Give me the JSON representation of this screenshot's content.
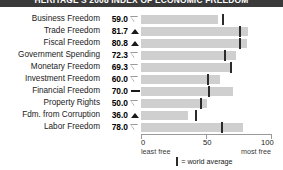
{
  "title": "HERITAGE'S 2008 INDEX OF ECONOMIC FREEDOM",
  "colors": {
    "bar": "#cfcfcf",
    "tick": "#2b2b2b",
    "titlebar": "#3a3a3a",
    "text": "#1a1a1a"
  },
  "chart_data": {
    "type": "bar",
    "title": "HERITAGE'S 2008 INDEX OF ECONOMIC FREEDOM",
    "orientation": "horizontal",
    "xlabel": "",
    "ylabel": "",
    "xlim": [
      0,
      100
    ],
    "ticks": [
      0,
      50,
      100
    ],
    "tick_labels": [
      "0",
      "50",
      "100"
    ],
    "axis_low_label": "least free",
    "axis_high_label": "most free",
    "grid": false,
    "legend": "= world average",
    "legend_position": "bottom-center",
    "categories": [
      "Business Freedom",
      "Trade Freedom",
      "Fiscal Freedom",
      "Government Spending",
      "Monetary Freedom",
      "Investment Freedom",
      "Financial Freedom",
      "Property Rights",
      "Fdm. from Corruption",
      "Labor Freedom"
    ],
    "values": [
      59.0,
      81.7,
      80.8,
      72.3,
      69.3,
      60.0,
      70.0,
      50.0,
      36.0,
      78.0
    ],
    "world_average": [
      62.0,
      75.0,
      75.0,
      63.0,
      68.0,
      50.0,
      51.0,
      45.0,
      41.0,
      61.0
    ],
    "trend": [
      "down",
      "up",
      "up",
      "down",
      "down",
      "down",
      "flat",
      "down",
      "up",
      "down"
    ],
    "value_labels": [
      "59.0",
      "81.7",
      "80.8",
      "72.3",
      "69.3",
      "60.0",
      "70.0",
      "50.0",
      "36.0",
      "78.0"
    ]
  },
  "rows": [
    {
      "label": "Business Freedom",
      "value": "59.0",
      "v": 59.0,
      "avg": 62.0,
      "trend": "down"
    },
    {
      "label": "Trade Freedom",
      "value": "81.7",
      "v": 81.7,
      "avg": 75.0,
      "trend": "up"
    },
    {
      "label": "Fiscal Freedom",
      "value": "80.8",
      "v": 80.8,
      "avg": 75.0,
      "trend": "up"
    },
    {
      "label": "Government Spending",
      "value": "72.3",
      "v": 72.3,
      "avg": 63.0,
      "trend": "down"
    },
    {
      "label": "Monetary Freedom",
      "value": "69.3",
      "v": 69.3,
      "avg": 68.0,
      "trend": "down"
    },
    {
      "label": "Investment Freedom",
      "value": "60.0",
      "v": 60.0,
      "avg": 50.0,
      "trend": "down"
    },
    {
      "label": "Financial Freedom",
      "value": "70.0",
      "v": 70.0,
      "avg": 51.0,
      "trend": "flat"
    },
    {
      "label": "Property Rights",
      "value": "50.0",
      "v": 50.0,
      "avg": 45.0,
      "trend": "down"
    },
    {
      "label": "Fdm. from Corruption",
      "value": "36.0",
      "v": 36.0,
      "avg": 41.0,
      "trend": "up"
    },
    {
      "label": "Labor Freedom",
      "value": "78.0",
      "v": 78.0,
      "avg": 61.0,
      "trend": "down"
    }
  ],
  "axis": {
    "t0": "0",
    "t50": "50",
    "t100": "100",
    "least": "least free",
    "most": "most free"
  },
  "legend": {
    "text": "= world average"
  }
}
